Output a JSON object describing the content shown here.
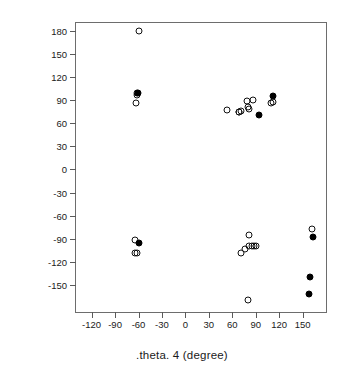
{
  "chart_data": {
    "type": "scatter",
    "title": "",
    "xlabel": ".theta. 4 (degree)",
    "ylabel": ".theta. 5 (degree)",
    "xlim": [
      -140,
      180
    ],
    "ylim": [
      -185,
      190
    ],
    "xticks": [
      -120,
      -90,
      -60,
      -30,
      0,
      30,
      60,
      90,
      120,
      150
    ],
    "xticklabels": [
      "-120",
      "-90",
      "-60",
      "-30",
      "0",
      "30",
      "60",
      "90",
      "120",
      "150"
    ],
    "yticks": [
      180,
      150,
      120,
      90,
      60,
      30,
      0,
      -30,
      -60,
      -90,
      -120,
      -150
    ],
    "yticklabels": [
      "180",
      "150",
      "120",
      "90",
      "60",
      "30",
      "0",
      "-30",
      "-60",
      "-90",
      "-120",
      "-150"
    ],
    "grid": false,
    "legend": false,
    "series": [
      {
        "name": "open-circles",
        "marker": "open-circle",
        "color": "#111111",
        "points": [
          [
            -59,
            179
          ],
          [
            -62,
            99
          ],
          [
            -62,
            97
          ],
          [
            -63,
            86
          ],
          [
            53,
            77
          ],
          [
            68,
            75
          ],
          [
            69,
            74
          ],
          [
            71,
            76
          ],
          [
            79,
            89
          ],
          [
            80,
            81
          ],
          [
            82,
            78
          ],
          [
            86,
            90
          ],
          [
            110,
            86
          ],
          [
            112,
            88
          ],
          [
            -64,
            -92
          ],
          [
            -65,
            -108
          ],
          [
            -62,
            -108
          ],
          [
            81,
            -85
          ],
          [
            71,
            -108
          ],
          [
            76,
            -103
          ],
          [
            82,
            -100
          ],
          [
            85,
            -100
          ],
          [
            88,
            -99
          ],
          [
            91,
            -99
          ],
          [
            80,
            -170
          ],
          [
            162,
            -77
          ]
        ]
      },
      {
        "name": "filled-circles",
        "marker": "filled-circle",
        "color": "#000000",
        "points": [
          [
            -61,
            99
          ],
          [
            94,
            70
          ],
          [
            112,
            95
          ],
          [
            -59,
            -95
          ],
          [
            163,
            -88
          ],
          [
            160,
            -139
          ],
          [
            158,
            -162
          ]
        ]
      }
    ]
  }
}
